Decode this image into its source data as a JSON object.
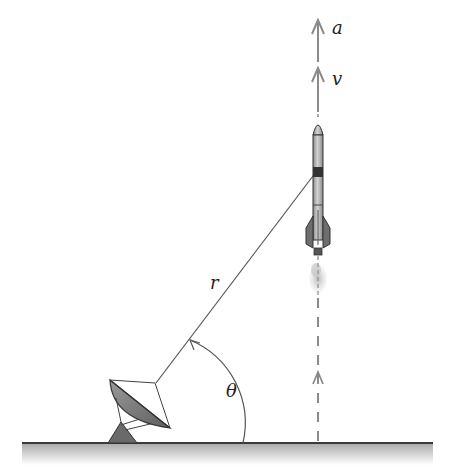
{
  "diagram": {
    "labels": {
      "acceleration": "a",
      "velocity": "v",
      "range": "r",
      "angle": "θ"
    },
    "elements": [
      "ground",
      "radar-dish",
      "rocket",
      "exhaust-plume",
      "range-line",
      "angle-arc",
      "trajectory-dashed-line",
      "acceleration-arrow",
      "velocity-arrow"
    ],
    "colors": {
      "line": "#555555",
      "arrow": "#8a8a8a",
      "ground": "#444444",
      "rocket_body": "#b5b5b5",
      "rocket_dark": "#6e6e6e",
      "dish": "#7a7a7a",
      "exhaust": "#c8c8c8"
    }
  }
}
